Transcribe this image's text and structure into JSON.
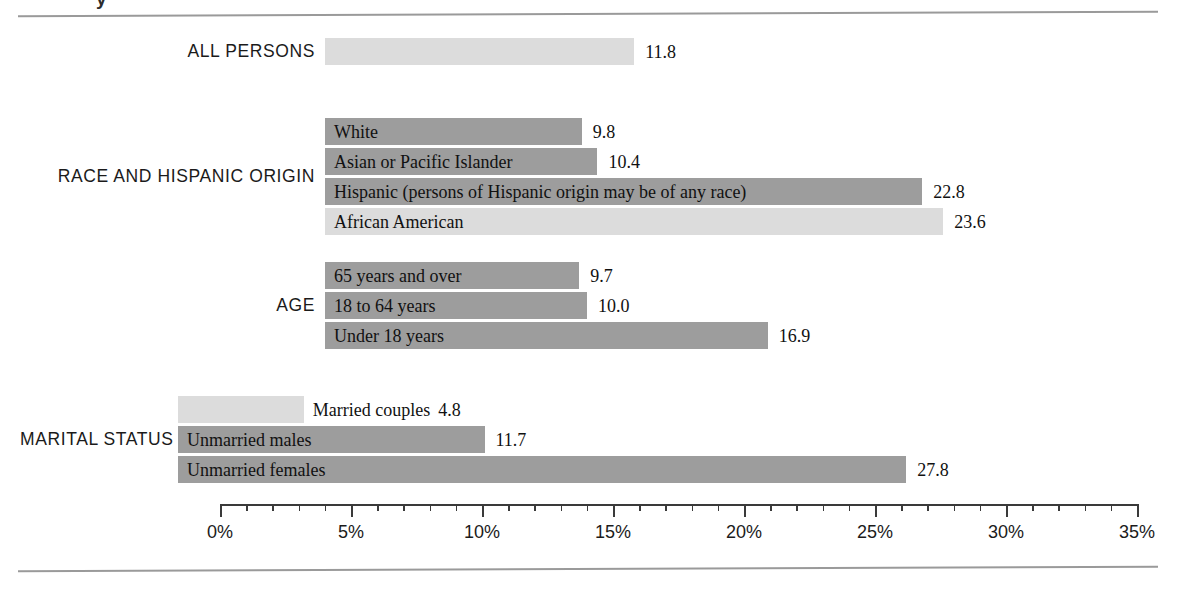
{
  "title_fragment": "y",
  "chart_data": {
    "type": "bar",
    "orientation": "horizontal",
    "title": "",
    "xlabel": "",
    "ylabel": "",
    "xlim": [
      0,
      35
    ],
    "xtick_labels": [
      "0%",
      "5%",
      "10%",
      "15%",
      "20%",
      "25%",
      "30%",
      "35%"
    ],
    "xtick_values": [
      0,
      5,
      10,
      15,
      20,
      25,
      30,
      35
    ],
    "minor_tick_step": 1,
    "grid": false,
    "legend": "none",
    "colors": {
      "dark_bar": "#9d9d9d",
      "light_bar": "#dcdcdc",
      "axis": "#3a3a3a",
      "rule": "#9a9a9a",
      "text": "#1a1a1a"
    },
    "groups": [
      {
        "group_label": "ALL PERSONS",
        "bars": [
          {
            "label": "",
            "value": 11.8,
            "value_text": "11.8",
            "shade": "light",
            "label_inside": false
          }
        ]
      },
      {
        "group_label": "RACE AND HISPANIC ORIGIN",
        "bars": [
          {
            "label": "White",
            "value": 9.8,
            "value_text": "9.8",
            "shade": "dark",
            "label_inside": true
          },
          {
            "label": "Asian or Pacific Islander",
            "value": 10.4,
            "value_text": "10.4",
            "shade": "dark",
            "label_inside": true
          },
          {
            "label": "Hispanic (persons of Hispanic origin may be of any race)",
            "value": 22.8,
            "value_text": "22.8",
            "shade": "dark",
            "label_inside": true
          },
          {
            "label": "African American",
            "value": 23.6,
            "value_text": "23.6",
            "shade": "light",
            "label_inside": true
          }
        ]
      },
      {
        "group_label": "AGE",
        "bars": [
          {
            "label": "65 years and over",
            "value": 9.7,
            "value_text": "9.7",
            "shade": "dark",
            "label_inside": true
          },
          {
            "label": "18 to 64 years",
            "value": 10.0,
            "value_text": "10.0",
            "shade": "dark",
            "label_inside": true
          },
          {
            "label": "Under 18 years",
            "value": 16.9,
            "value_text": "16.9",
            "shade": "dark",
            "label_inside": true
          }
        ]
      },
      {
        "group_label": "MARITAL STATUS",
        "bars": [
          {
            "label": "Married couples",
            "value": 4.8,
            "value_text": "4.8",
            "shade": "light",
            "label_inside": false
          },
          {
            "label": "Unmarried males",
            "value": 11.7,
            "value_text": "11.7",
            "shade": "dark",
            "label_inside": true
          },
          {
            "label": "Unmarried females",
            "value": 27.8,
            "value_text": "27.8",
            "shade": "dark",
            "label_inside": true
          }
        ]
      }
    ]
  }
}
